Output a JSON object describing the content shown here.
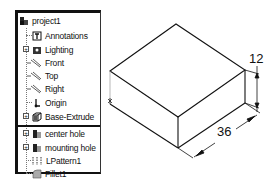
{
  "feature_tree": {
    "root": {
      "label": "project1",
      "icon": "part-icon"
    },
    "items": [
      {
        "label": "Annotations",
        "icon": "annotations-icon",
        "expandable": false
      },
      {
        "label": "Lighting",
        "icon": "lighting-icon",
        "expandable": true
      },
      {
        "label": "Front",
        "icon": "plane-icon",
        "expandable": false
      },
      {
        "label": "Top",
        "icon": "plane-icon",
        "expandable": false
      },
      {
        "label": "Right",
        "icon": "plane-icon",
        "expandable": false
      },
      {
        "label": "Origin",
        "icon": "origin-icon",
        "expandable": false
      },
      {
        "label": "Base-Extrude",
        "icon": "extrude-icon",
        "expandable": true
      },
      {
        "label": "center hole",
        "icon": "hole-icon",
        "expandable": true
      },
      {
        "label": "mounting hole",
        "icon": "hole-icon",
        "expandable": true
      },
      {
        "label": "LPattern1",
        "icon": "linear-pattern-icon",
        "expandable": false
      },
      {
        "label": "Fillet1",
        "icon": "fillet-icon",
        "expandable": false
      }
    ]
  },
  "drawing": {
    "dimensions": {
      "height": "12",
      "length": "36"
    }
  },
  "colors": {
    "line": "#111111",
    "background": "#ffffff"
  }
}
